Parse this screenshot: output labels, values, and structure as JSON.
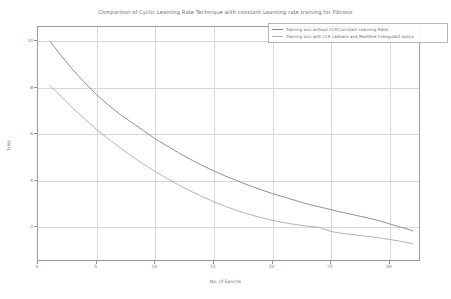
{
  "chart_data": {
    "type": "line",
    "title": "Comparison of Cyclic Learning Rate Technique with constant Learning rate training for Fibrosis",
    "xlabel": "No.  of Epochs",
    "ylabel": "Loss",
    "xlim": [
      0,
      32.5
    ],
    "ylim": [
      0.6,
      10.6
    ],
    "xticks": [
      0,
      5,
      10,
      15,
      20,
      25,
      30
    ],
    "yticks": [
      2,
      4,
      6,
      8,
      10
    ],
    "grid": true,
    "legend_position": "top-right",
    "series": [
      {
        "name": "Training loss without CLR(Constant Learning Rate)",
        "color": "#7d8597",
        "x": [
          1,
          2,
          3,
          4,
          5,
          6,
          7,
          8,
          9,
          10,
          11,
          12,
          13,
          14,
          15,
          16,
          17,
          18,
          19,
          20,
          21,
          22,
          23,
          24,
          25,
          26,
          27,
          28,
          29,
          30,
          31,
          32
        ],
        "values": [
          10.0,
          9.35,
          8.75,
          8.2,
          7.7,
          7.25,
          6.85,
          6.5,
          6.15,
          5.8,
          5.5,
          5.2,
          4.92,
          4.66,
          4.42,
          4.2,
          4.0,
          3.8,
          3.62,
          3.45,
          3.3,
          3.15,
          3.0,
          2.88,
          2.76,
          2.64,
          2.53,
          2.42,
          2.3,
          2.15,
          2.0,
          1.85
        ]
      },
      {
        "name": "Training loss with CLR callback and Modified triangular2 policy",
        "color": "#b7a89a",
        "x": [
          1,
          2,
          3,
          4,
          5,
          6,
          7,
          8,
          9,
          10,
          11,
          12,
          13,
          14,
          15,
          16,
          17,
          18,
          19,
          20,
          21,
          22,
          23,
          24,
          25,
          26,
          27,
          28,
          29,
          30,
          31,
          32
        ],
        "values": [
          8.1,
          7.6,
          7.1,
          6.65,
          6.2,
          5.8,
          5.42,
          5.05,
          4.72,
          4.4,
          4.1,
          3.82,
          3.56,
          3.32,
          3.1,
          2.9,
          2.72,
          2.56,
          2.42,
          2.3,
          2.2,
          2.12,
          2.05,
          2.0,
          1.82,
          1.74,
          1.68,
          1.62,
          1.56,
          1.48,
          1.4,
          1.3
        ]
      }
    ]
  },
  "legend": {
    "entries": [
      {
        "label": "Training loss without CLR(Constant Learning Rate)"
      },
      {
        "label": "Training loss with CLR callback and Modified triangular2 policy"
      }
    ]
  }
}
